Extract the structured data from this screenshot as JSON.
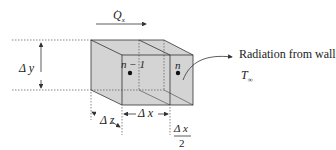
{
  "diagram": {
    "heat_flow_label": "Q",
    "heat_flow_subscript": "x",
    "delta_y": "Δ y",
    "delta_z": "Δ z",
    "delta_x": "Δ x",
    "half_dx_num": "Δ x",
    "half_dx_den": "2",
    "node_left": "n − 1",
    "node_right": "n",
    "radiation_label": "Radiation from wall",
    "t_inf": "T",
    "t_inf_sub": "∞",
    "colors": {
      "fill": "#d4d4d4",
      "stroke": "#333333"
    }
  }
}
